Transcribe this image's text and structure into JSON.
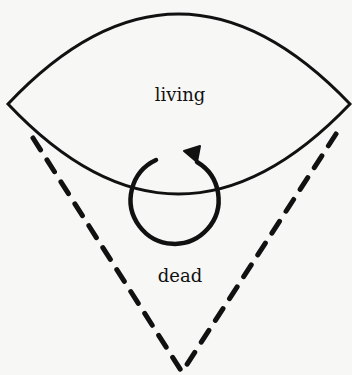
{
  "diagram": {
    "labels": {
      "living": "living",
      "dead": "dead"
    },
    "colors": {
      "stroke": "#111111",
      "background": "#f7f7f5"
    },
    "elements": {
      "lens_region": "living",
      "cone_region": "dead",
      "cycle_arrow": "circular arrow crossing boundary"
    }
  }
}
